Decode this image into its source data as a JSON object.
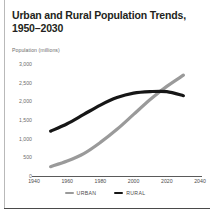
{
  "chart_data": {
    "type": "line",
    "title": "Urban and Rural Population Trends, 1950–2030",
    "title_line1": "Urban and Rural Population Trends,",
    "title_line2": "1950–2030",
    "ylabel": "Population (millions)",
    "xlabel": "",
    "grid": false,
    "legend_position": "bottom",
    "xlim": [
      1940,
      2040
    ],
    "ylim": [
      0,
      3000
    ],
    "xticks": [
      "1940",
      "1960",
      "1980",
      "2000",
      "2020",
      "2040"
    ],
    "xtick_values": [
      1940,
      1960,
      1980,
      2000,
      2020,
      2040
    ],
    "yticks": [
      "3,000",
      "2,500",
      "2,000",
      "1,500",
      "1,000",
      "500",
      "0"
    ],
    "ytick_values": [
      3000,
      2500,
      2000,
      1500,
      1000,
      500,
      0
    ],
    "x": [
      1950,
      1960,
      1970,
      1980,
      1990,
      2000,
      2010,
      2020,
      2030
    ],
    "series": [
      {
        "name": "URBAN",
        "color": "#9a9a9a",
        "values": [
          250,
          400,
          600,
          900,
          1250,
          1650,
          2050,
          2400,
          2700
        ]
      },
      {
        "name": "RURAL",
        "color": "#161616",
        "values": [
          1200,
          1400,
          1650,
          1900,
          2100,
          2220,
          2260,
          2260,
          2150
        ]
      }
    ]
  },
  "legend": {
    "items": [
      {
        "label": "URBAN",
        "color": "#9a9a9a"
      },
      {
        "label": "RURAL",
        "color": "#161616"
      }
    ]
  }
}
